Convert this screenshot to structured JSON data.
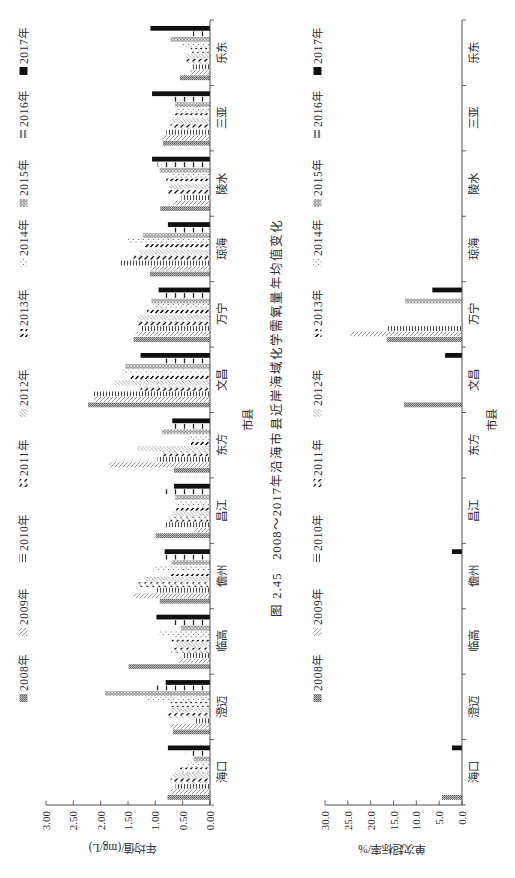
{
  "figure": {
    "caption": "图 2.45   2008～2017年沿海市县近岸海域化学需氧量年均值变化"
  },
  "chart_data": [
    {
      "type": "bar",
      "title": "",
      "xlabel": "市县",
      "ylabel": "年均值/(mg/L)",
      "ylim": [
        0,
        3
      ],
      "yticks": [
        "0.00",
        "0.50",
        "1.00",
        "1.50",
        "2.00",
        "2.50",
        "3.00"
      ],
      "grid": false,
      "legend_position": "top",
      "categories": [
        "海口",
        "澄迈",
        "临高",
        "儋州",
        "昌江",
        "东方",
        "文昌",
        "万宁",
        "琼海",
        "陵水",
        "三亚",
        "乐东"
      ],
      "series": [
        {
          "name": "2008年",
          "values": [
            0.78,
            0.68,
            1.49,
            0.92,
            0.99,
            0.66,
            2.23,
            1.4,
            1.1,
            0.91,
            0.86,
            0.55
          ]
        },
        {
          "name": "2009年",
          "values": [
            0.72,
            0.72,
            0.57,
            1.4,
            0.28,
            1.84,
            2.12,
            1.36,
            1.09,
            0.67,
            0.86,
            0.37
          ]
        },
        {
          "name": "2010年",
          "values": [
            0.63,
            0.29,
            0.5,
            0.99,
            0.83,
            0.96,
            2.14,
            1.27,
            1.65,
            0.52,
            0.8,
            0.34
          ]
        },
        {
          "name": "2011年",
          "values": [
            0.72,
            0.81,
            0.72,
            1.31,
            0.74,
            0.88,
            1.27,
            1.33,
            1.4,
            0.77,
            0.72,
            0.43
          ]
        },
        {
          "name": "2012年",
          "values": [
            0.68,
            0.7,
            0.62,
            1.2,
            0.7,
            1.34,
            1.75,
            1.31,
            1.3,
            0.75,
            0.7,
            0.45
          ]
        },
        {
          "name": "2013年",
          "values": [
            0.55,
            0.72,
            0.7,
            0.75,
            0.62,
            0.35,
            1.45,
            1.15,
            1.2,
            0.8,
            0.68,
            0.35
          ]
        },
        {
          "name": "2014年",
          "values": [
            0.4,
            1.18,
            0.94,
            1.03,
            0.6,
            0.4,
            1.6,
            1.03,
            1.5,
            0.7,
            0.62,
            0.52
          ]
        },
        {
          "name": "2015年",
          "values": [
            0.3,
            1.92,
            0.53,
            0.7,
            0.64,
            0.88,
            1.55,
            1.07,
            1.23,
            0.92,
            0.64,
            0.72
          ]
        },
        {
          "name": "2016年",
          "values": [
            0.45,
            1.03,
            0.68,
            0.87,
            0.85,
            0.77,
            0.83,
            0.85,
            0.7,
            0.96,
            0.67,
            0.31
          ]
        },
        {
          "name": "2017年",
          "values": [
            0.77,
            0.81,
            0.98,
            0.83,
            0.66,
            0.69,
            1.27,
            0.94,
            0.77,
            1.06,
            1.06,
            1.09
          ]
        }
      ]
    },
    {
      "type": "bar",
      "title": "",
      "xlabel": "市县",
      "ylabel": "单次超标率/%",
      "ylim": [
        0,
        30
      ],
      "yticks": [
        "0.0",
        "5.0",
        "10.0",
        "15.0",
        "20.0",
        "25.0",
        "30.0"
      ],
      "grid": false,
      "legend_position": "top",
      "categories": [
        "海口",
        "澄迈",
        "临高",
        "儋州",
        "昌江",
        "东方",
        "文昌",
        "万宁",
        "琼海",
        "陵水",
        "三亚",
        "乐东"
      ],
      "series": [
        {
          "name": "2008年",
          "values": [
            4.4,
            0,
            0,
            0,
            0,
            0,
            12.7,
            16.5,
            0,
            0,
            0,
            0
          ]
        },
        {
          "name": "2009年",
          "values": [
            0,
            0,
            0,
            0,
            0,
            0,
            0,
            24.5,
            0,
            0,
            0,
            0
          ]
        },
        {
          "name": "2010年",
          "values": [
            0,
            0,
            0,
            0,
            0,
            0,
            0,
            16.5,
            0,
            0,
            0,
            0
          ]
        },
        {
          "name": "2011年",
          "values": [
            0,
            0,
            0,
            0,
            0,
            0,
            0,
            0,
            0,
            0,
            0,
            0
          ]
        },
        {
          "name": "2012年",
          "values": [
            0,
            0,
            0,
            0,
            0,
            0,
            0,
            0,
            0,
            0,
            0,
            0
          ]
        },
        {
          "name": "2013年",
          "values": [
            0,
            0,
            0,
            0,
            0,
            0,
            0,
            0,
            0,
            0,
            0,
            0
          ]
        },
        {
          "name": "2014年",
          "values": [
            0,
            0,
            0,
            0,
            0,
            0,
            0,
            0,
            0,
            0,
            0,
            0
          ]
        },
        {
          "name": "2015年",
          "values": [
            0,
            0,
            0,
            0,
            0,
            0,
            0,
            12.5,
            0,
            0,
            0,
            0
          ]
        },
        {
          "name": "2016年",
          "values": [
            0,
            0,
            0,
            0,
            0,
            0,
            0,
            0,
            0,
            0,
            0,
            0
          ]
        },
        {
          "name": "2017年",
          "values": [
            2.2,
            0,
            0,
            2.2,
            0,
            0,
            3.7,
            6.5,
            0,
            0,
            0,
            0
          ]
        }
      ]
    }
  ]
}
